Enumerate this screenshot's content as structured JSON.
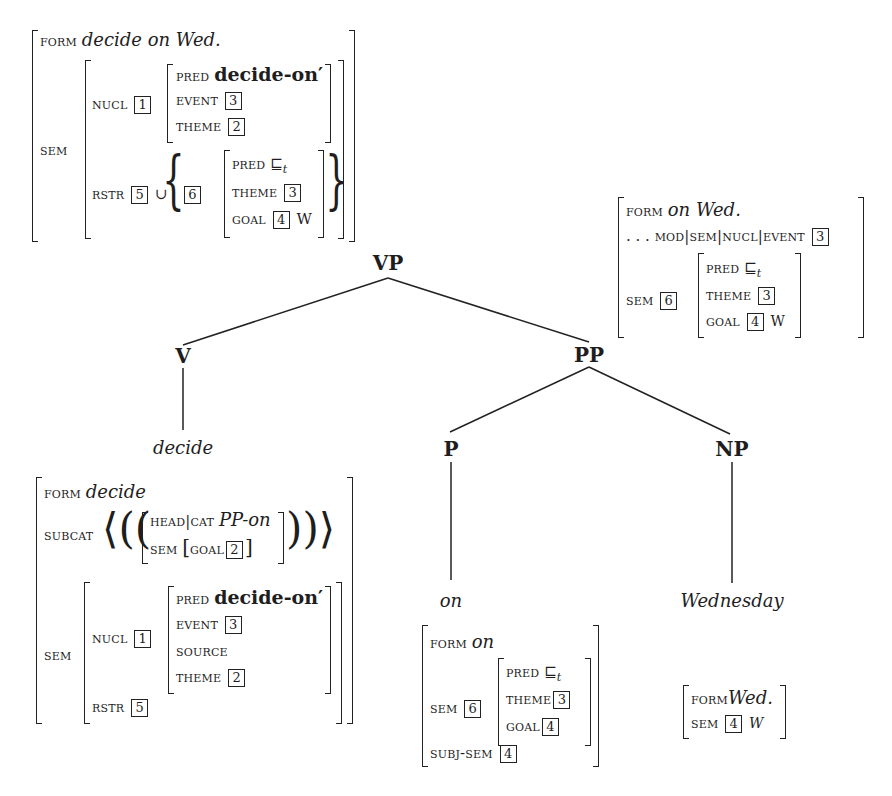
{
  "tree": {
    "nodes": {
      "vp": "VP",
      "v": "V",
      "pp": "PP",
      "p": "P",
      "np": "NP"
    },
    "leaves": {
      "v": "decide",
      "p": "on",
      "np": "Wednesday"
    }
  },
  "avm_vp": {
    "form_label": "FORM",
    "form_value": "decide on Wed.",
    "sem_label": "SEM",
    "nucl_label": "NUCL",
    "nucl_tag": "1",
    "pred_label": "PRED",
    "pred_value": "decide-on′",
    "event_label": "EVENT",
    "event_tag": "3",
    "theme_label": "THEME",
    "theme_tag": "2",
    "rstr_label": "RSTR",
    "rstr_tag": "5",
    "union": "∪",
    "set_tag": "6",
    "set_pred_label": "PRED",
    "set_pred_value": "⊑",
    "set_pred_sub": "t",
    "set_theme_label": "THEME",
    "set_theme_tag": "3",
    "set_goal_label": "GOAL",
    "set_goal_tag": "4",
    "set_goal_value": "W"
  },
  "avm_pp": {
    "form_label": "FORM",
    "form_value": "on Wed.",
    "path_prefix": ". . .",
    "path_label": "MOD|SEM|NUCL|EVENT",
    "path_tag": "3",
    "sem_label": "SEM",
    "sem_tag": "6",
    "pred_label": "PRED",
    "pred_value": "⊑",
    "pred_sub": "t",
    "theme_label": "THEME",
    "theme_tag": "3",
    "goal_label": "GOAL",
    "goal_tag": "4",
    "goal_value": "W"
  },
  "avm_v": {
    "form_label": "FORM",
    "form_value": "decide",
    "subcat_label": "SUBCAT",
    "headcat_label": "HEAD|CAT",
    "headcat_value": "PP-on",
    "subsem_label": "SEM",
    "subgoal_label": "GOAL",
    "subgoal_tag": "2",
    "sem_label": "SEM",
    "nucl_label": "NUCL",
    "nucl_tag": "1",
    "pred_label": "PRED",
    "pred_value": "decide-on′",
    "event_label": "EVENT",
    "event_tag": "3",
    "source_label": "SOURCE",
    "theme_label": "THEME",
    "theme_tag": "2",
    "rstr_label": "RSTR",
    "rstr_tag": "5"
  },
  "avm_p": {
    "form_label": "FORM",
    "form_value": "on",
    "sem_label": "SEM",
    "sem_tag": "6",
    "pred_label": "PRED",
    "pred_value": "⊑",
    "pred_sub": "t",
    "theme_label": "THEME",
    "theme_tag": "3",
    "goal_label": "GOAL",
    "goal_tag": "4",
    "subjsem_label": "SUBJ-SEM",
    "subjsem_tag": "4"
  },
  "avm_np": {
    "form_label": "FORM",
    "form_value": "Wed.",
    "sem_label": "SEM",
    "sem_tag": "4",
    "sem_value": "W"
  }
}
